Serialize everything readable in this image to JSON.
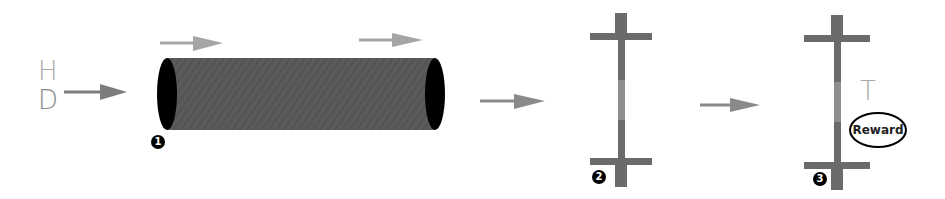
{
  "inputs": {
    "h_label": "H",
    "d_label": "D",
    "h_color": "#a8a8a8",
    "d_color": "#8a8a8a"
  },
  "stages": [
    {
      "badge": "1",
      "shape": "cylinder"
    },
    {
      "badge": "2",
      "shape": "pole"
    },
    {
      "badge": "3",
      "shape": "pole"
    }
  ],
  "output": {
    "t_label": "T",
    "reward_label": "Reward",
    "t_color": "#a8a8a8"
  },
  "colors": {
    "cylinder_body": "#5a5a5a",
    "cylinder_cap": "#000000",
    "pole": "#6b6b6b",
    "pole_highlight": "#8e8e8e",
    "arrow_dark": "#7d7d7d",
    "arrow_light": "#a5a5a5"
  }
}
